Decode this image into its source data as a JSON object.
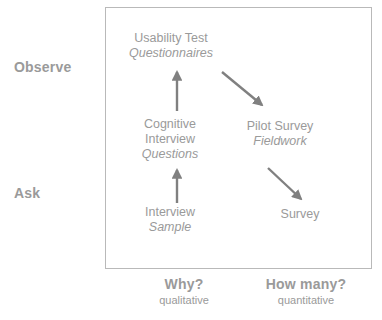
{
  "diagram": {
    "title_present": false,
    "accent_color": "#9a9a9a",
    "arrow_color": "#808080",
    "frame_color": "#b9b9b9",
    "y_axis": {
      "top_label": "Observe",
      "bottom_label": "Ask"
    },
    "x_axis": {
      "left": {
        "question": "Why?",
        "method": "qualitative"
      },
      "right": {
        "question": "How many?",
        "method": "quantitative"
      }
    },
    "nodes": [
      {
        "id": "usability-test",
        "main": "Usability Test",
        "sub": "Questionnaires"
      },
      {
        "id": "cognitive-interview",
        "main_line1": "Cognitive",
        "main_line2": "Interview",
        "sub": "Questions"
      },
      {
        "id": "pilot-survey",
        "main": "Pilot Survey",
        "sub": "Fieldwork"
      },
      {
        "id": "interview",
        "main": "Interview",
        "sub": "Sample"
      },
      {
        "id": "survey",
        "main": "Survey",
        "sub": ""
      }
    ],
    "arrows": [
      {
        "id": "interview-to-cognitive",
        "from": "interview",
        "to": "cognitive-interview",
        "direction": "up"
      },
      {
        "id": "cognitive-to-usability",
        "from": "cognitive-interview",
        "to": "usability-test",
        "direction": "up"
      },
      {
        "id": "usability-to-pilot",
        "from": "usability-test",
        "to": "pilot-survey",
        "direction": "down-right"
      },
      {
        "id": "pilot-to-survey",
        "from": "pilot-survey",
        "to": "survey",
        "direction": "down-right"
      }
    ]
  }
}
